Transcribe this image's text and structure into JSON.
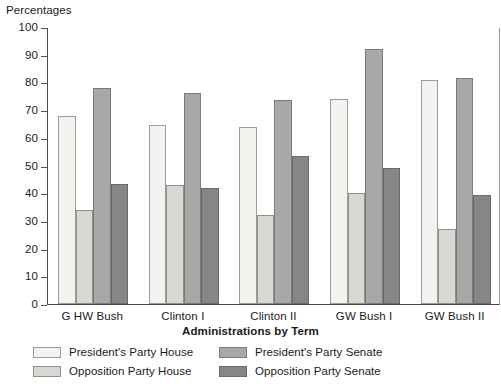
{
  "chart_data": {
    "type": "bar",
    "title": "",
    "ylabel": "Percentages",
    "xlabel": "Administrations by Term",
    "ylim": [
      0,
      100
    ],
    "yticks": [
      0,
      10,
      20,
      30,
      40,
      50,
      60,
      70,
      80,
      90,
      100
    ],
    "grid": false,
    "legend_position": "bottom",
    "categories": [
      "G HW Bush",
      "Clinton I",
      "Clinton II",
      "GW Bush I",
      "GW Bush II"
    ],
    "series": [
      {
        "name": "President's Party House",
        "color": "#f2f2ef",
        "values": [
          68,
          64.5,
          64,
          74,
          81
        ]
      },
      {
        "name": "Opposition Party House",
        "color": "#d9d9d4",
        "values": [
          34,
          43,
          32,
          40,
          27
        ]
      },
      {
        "name": "President's Party Senate",
        "color": "#a8a8a6",
        "values": [
          78,
          76,
          73.5,
          92,
          81.5
        ]
      },
      {
        "name": "Opposition Party Senate",
        "color": "#868686",
        "values": [
          43.5,
          42,
          53.5,
          49,
          39.5
        ]
      }
    ]
  },
  "axes": {
    "y_title": "Percentages",
    "x_title": "Administrations by Term"
  },
  "legend": {
    "items": [
      {
        "label": "President's Party House",
        "series": 0
      },
      {
        "label": "Opposition Party House",
        "series": 1
      },
      {
        "label": "President's Party Senate",
        "series": 2
      },
      {
        "label": "Opposition Party Senate",
        "series": 3
      }
    ]
  }
}
